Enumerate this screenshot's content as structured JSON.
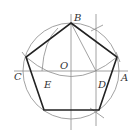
{
  "diagram": {
    "colors": {
      "thin": "#8a8a8a",
      "thick": "#222222",
      "label": "#333333"
    },
    "circle": {
      "cx": 71,
      "cy": 71,
      "r": 48
    },
    "labels": {
      "B": "B",
      "C": "C",
      "O": "O",
      "E": "E",
      "D": "D",
      "A": "A"
    },
    "points": {
      "B": [
        71,
        23
      ],
      "C": [
        23,
        71
      ],
      "A": [
        119,
        71
      ],
      "O": [
        71,
        71
      ],
      "D": [
        96,
        71
      ],
      "E": [
        42,
        71
      ],
      "P1": [
        117,
        57
      ],
      "P2": [
        99,
        110
      ],
      "P3": [
        44,
        110
      ],
      "P4": [
        26,
        57
      ]
    }
  }
}
